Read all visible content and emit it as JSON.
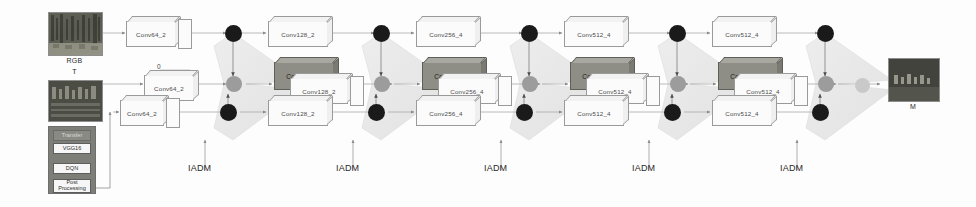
{
  "figure": {
    "background_color": "#fdfdfd",
    "node_black": "#1a1a1a",
    "node_gray": "#9c9c9c",
    "conv_dark_fill": "#8e8e86",
    "fusion_fill": "#e9e9e9"
  },
  "inputs": {
    "rgb_label": "RGB",
    "thermal_label": "T"
  },
  "output": {
    "label": "M"
  },
  "annotations": {
    "zero": "0"
  },
  "agent_stack": {
    "cells": [
      {
        "label": "Transfer",
        "ghost": true
      },
      {
        "label": "VGG16",
        "ghost": false
      },
      {
        "label": "DQN",
        "ghost": false
      },
      {
        "label": "Post\nProcessing",
        "ghost": false
      }
    ]
  },
  "stages": [
    {
      "name": "stage-1",
      "iadm_label": "IADM",
      "conv_top": "Conv128_2",
      "conv_mid_dark": "Conv128_2",
      "conv_mid_light": "Conv128_2",
      "conv_bottom": "Conv128_2"
    },
    {
      "name": "stage-2",
      "iadm_label": "IADM",
      "conv_top": "Conv256_4",
      "conv_mid_dark": "Conv256_4",
      "conv_mid_light": "Conv256_4",
      "conv_bottom": "Conv256_4"
    },
    {
      "name": "stage-3",
      "iadm_label": "IADM",
      "conv_top": "Conv512_4",
      "conv_mid_dark": "Conv512_4",
      "conv_mid_light": "Conv512_4",
      "conv_bottom": "Conv512_4"
    },
    {
      "name": "stage-4",
      "iadm_label": "IADM",
      "conv_top": "Conv512_4",
      "conv_mid_dark": "Conv512_4",
      "conv_mid_light": "Conv512_4",
      "conv_bottom": "Conv512_4"
    },
    {
      "name": "stage-5",
      "iadm_label": "IADM",
      "conv_top": "",
      "conv_mid_dark": "",
      "conv_mid_light": "",
      "conv_bottom": ""
    }
  ],
  "stem": {
    "conv_rgb": "Conv64_2",
    "conv_thermal": "Conv64_2",
    "conv_agent": "Conv64_2"
  }
}
